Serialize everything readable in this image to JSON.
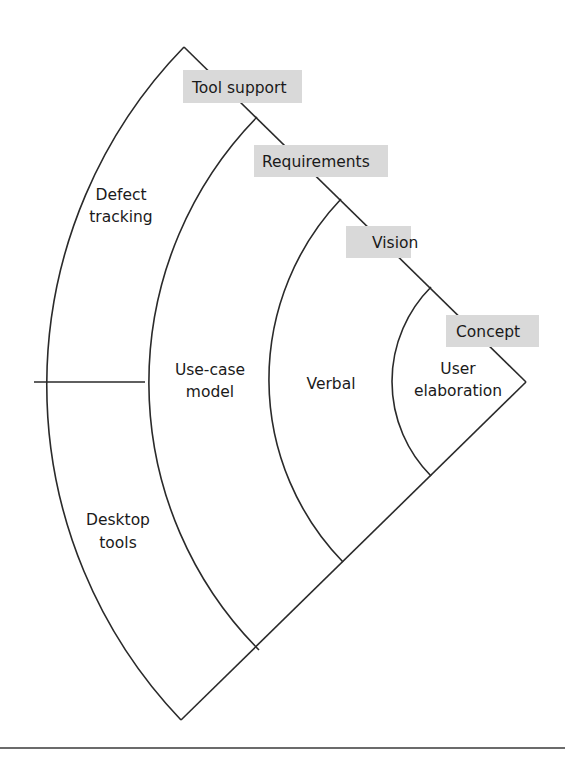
{
  "diagram": {
    "type": "nested-sector",
    "layers": [
      {
        "label": "Tool support",
        "order": 1
      },
      {
        "label": "Requirements",
        "order": 2
      },
      {
        "label": "Vision",
        "order": 3
      },
      {
        "label": "Concept",
        "order": 4
      }
    ],
    "regions": {
      "tool_support_upper": {
        "line1": "Defect",
        "line2": "tracking"
      },
      "tool_support_lower": {
        "line1": "Desktop",
        "line2": "tools"
      },
      "requirements": {
        "line1": "Use-case",
        "line2": "model"
      },
      "vision": {
        "line1": "Verbal"
      },
      "concept": {
        "line1": "User",
        "line2": "elaboration"
      }
    },
    "colors": {
      "line": "#2a2a2a",
      "label_box": "#d9d9d9",
      "background": "#ffffff"
    }
  }
}
